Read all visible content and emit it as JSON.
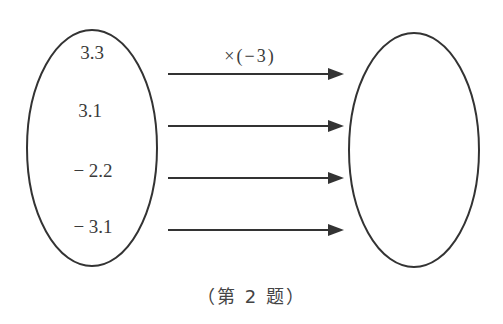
{
  "diagram": {
    "operation_label": "×(−3)",
    "input_values": [
      "3.3",
      "3.1",
      "− 2.2",
      "− 3.1"
    ],
    "output_values": [],
    "caption": "（第 2 题）"
  },
  "colors": {
    "stroke": "#333333",
    "text": "#3a3a3a",
    "background": "#ffffff"
  }
}
